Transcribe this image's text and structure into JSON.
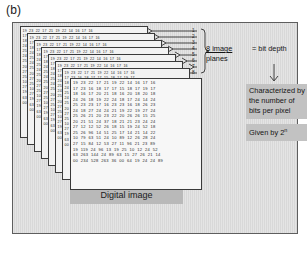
{
  "figure": {
    "panel_label": "(b)",
    "digital_image_label": "Digital image",
    "planes_note_line1": "8 image",
    "planes_note_line2": "planes",
    "bit_depth_note": "= bit depth",
    "characterized_note": "Characterized by the number of bits per pixel",
    "given_by_note": "Given by 2",
    "given_by_exponent": "n",
    "plane_count": 8,
    "plane_numbers": [
      "1",
      "2",
      "3",
      "4",
      "5",
      "6",
      "7",
      "8"
    ],
    "colors": {
      "panel_background": "#d8d8d8",
      "panel_border": "#5e5e5e",
      "plane_fill": "#f2f2f2",
      "plane_front_fill": "#f7f7f7",
      "plane_border": "#3a3a3a",
      "callout_background": "#c2c2c2",
      "caption_background": "#b9b9b9",
      "text": "#151515"
    }
  },
  "chart_data": {
    "type": "table",
    "front_plane_rows": [
      [
        "19",
        "23",
        "22",
        "17",
        "21",
        "19",
        "22",
        "14",
        "16",
        "17",
        "16"
      ],
      [
        "17",
        "23",
        "16",
        "18",
        "17",
        "17",
        "15",
        "18",
        "17",
        "19",
        "17"
      ],
      [
        "18",
        "16",
        "17",
        "20",
        "21",
        "18",
        "16",
        "20",
        "18",
        "20",
        "18"
      ],
      [
        "24",
        "26",
        "18",
        "19",
        "22",
        "24",
        "18",
        "17",
        "24",
        "14",
        "24"
      ],
      [
        "25",
        "23",
        "23",
        "17",
        "16",
        "23",
        "23",
        "16",
        "18",
        "26",
        "23"
      ],
      [
        "24",
        "18",
        "27",
        "24",
        "24",
        "21",
        "19",
        "22",
        "19",
        "27",
        "24"
      ],
      [
        "25",
        "26",
        "21",
        "20",
        "23",
        "22",
        "20",
        "26",
        "26",
        "15",
        "25"
      ],
      [
        "20",
        "21",
        "51",
        "24",
        "37",
        "18",
        "21",
        "21",
        "23",
        "24",
        "24"
      ],
      [
        "27",
        "12",
        "12",
        "52",
        "26",
        "18",
        "15",
        "19",
        "24",
        "52",
        "18"
      ],
      [
        "25",
        "26",
        "96",
        "14",
        "51",
        "25",
        "17",
        "14",
        "21",
        "14",
        "22"
      ],
      [
        "10",
        "79",
        "63",
        "51",
        "24",
        "10",
        "89",
        "12",
        "26",
        "28",
        "24"
      ],
      [
        "27",
        "15",
        "84",
        "12",
        "53",
        "27",
        "11",
        "96",
        "21",
        "23",
        "89"
      ],
      [
        "19",
        "119",
        "24",
        "96",
        "13",
        "19",
        "25",
        "10",
        "12",
        "24",
        "52"
      ],
      [
        "63",
        "263",
        "144",
        "24",
        "89",
        "63",
        "15",
        "27",
        "26",
        "21",
        "14"
      ],
      [
        "00",
        "234",
        "528",
        "263",
        "36",
        "00",
        "64",
        "19",
        "24",
        "24",
        "89"
      ]
    ],
    "back_plane_first_row": [
      "19",
      "23",
      "22",
      "17",
      "21",
      "19",
      "22",
      "14",
      "16",
      "17",
      "16"
    ],
    "plane_index_labels": [
      "1",
      "2",
      "3",
      "4",
      "5",
      "6",
      "7",
      "8"
    ]
  }
}
